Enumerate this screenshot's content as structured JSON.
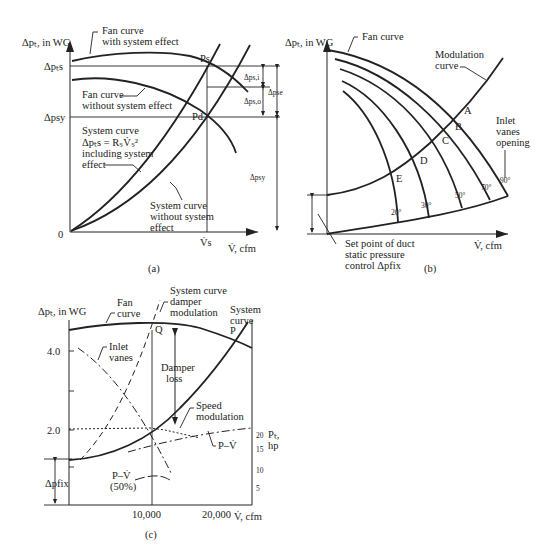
{
  "figure": {
    "panels": [
      {
        "id": "a",
        "caption": "(a)",
        "ylabel": "Δpₜ, in WG",
        "xlabel": "V̇, cfm",
        "origin_label": "0",
        "y_ticks": [
          "Δpₜs",
          "Δpsy"
        ],
        "x_ticks": [
          "V̇s"
        ],
        "labels": {
          "fan_with": "Fan curve",
          "fan_with2": "with system effect",
          "fan_without": "Fan curve",
          "fan_without2": "without system effect",
          "sys_incl1": "System curve",
          "sys_incl2": "Δpₜs = RₛV̇ₛ²",
          "sys_incl3": "including system",
          "sys_incl4": "effect",
          "sys_wo1": "System curve",
          "sys_wo2": "without system",
          "sys_wo3": "effect",
          "ps": "Ps",
          "pd": "Pd",
          "dps_i": "Δps,i",
          "dps_o": "Δps,o",
          "dpse": "Δpse",
          "dpsy": "Δpsy"
        }
      },
      {
        "id": "b",
        "caption": "(b)",
        "ylabel": "Δpₜ, in WG",
        "xlabel": "V̇, cfm",
        "labels": {
          "fan": "Fan curve",
          "mod1": "Modulation",
          "mod2": "curve",
          "inlet1": "Inlet",
          "inlet2": "vanes",
          "inlet3": "opening",
          "set1": "Set point of duct",
          "set2": "static pressure",
          "set3": "control Δpfix"
        },
        "points": [
          "A",
          "B",
          "C",
          "D",
          "E"
        ],
        "vane_angles": [
          "20°",
          "30°",
          "50°",
          "70°",
          "90°"
        ]
      },
      {
        "id": "c",
        "caption": "(c)",
        "ylabel": "Δpₜ, in WG",
        "xlabel": "V̇, cfm",
        "y_ticks": [
          "4.0",
          "2.0"
        ],
        "x_ticks": [
          "10,000",
          "20,000"
        ],
        "y2_label1": "Pₜ,",
        "y2_label2": "hp",
        "y2_ticks": [
          "20",
          "15",
          "10",
          "5"
        ],
        "labels": {
          "fan1": "Fan",
          "fan2": "curve",
          "damp1": "System curve",
          "damp2": "damper",
          "damp3": "modulation",
          "sys1": "System",
          "sys2": "curve",
          "q": "Q",
          "p": "P",
          "inlet1": "Inlet",
          "inlet2": "vanes",
          "dl1": "Damper",
          "dl2": "loss",
          "speed1": "Speed",
          "speed2": "modulation",
          "pv": "P–V̇",
          "pv50a": "P–V̇",
          "pv50b": "(50%)",
          "dpfix": "Δpfix"
        }
      }
    ]
  }
}
